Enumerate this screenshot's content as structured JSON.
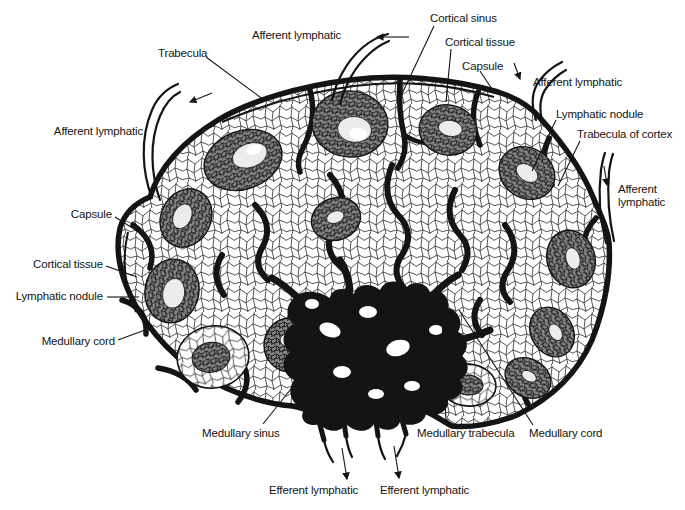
{
  "figure": {
    "background_color": "#ffffff",
    "ink_color": "#141414",
    "labels": [
      {
        "id": "trabecula",
        "text": "Trabecula"
      },
      {
        "id": "afferent-lymphatic-top",
        "text": "Afferent lymphatic"
      },
      {
        "id": "cortical-sinus",
        "text": "Cortical sinus"
      },
      {
        "id": "cortical-tissue-top",
        "text": "Cortical tissue"
      },
      {
        "id": "capsule-top",
        "text": "Capsule"
      },
      {
        "id": "afferent-lymphatic-upper-right",
        "text": "Afferent lymphatic"
      },
      {
        "id": "lymphatic-nodule-right",
        "text": "Lymphatic nodule"
      },
      {
        "id": "trabecula-of-cortex",
        "text": "Trabecula of cortex"
      },
      {
        "id": "afferent-lymphatic-far-right",
        "text": "Afferent lymphatic"
      },
      {
        "id": "afferent-lymphatic-left",
        "text": "Afferent lymphatic"
      },
      {
        "id": "capsule-left",
        "text": "Capsule"
      },
      {
        "id": "cortical-tissue-left",
        "text": "Cortical tissue"
      },
      {
        "id": "lymphatic-nodule-left",
        "text": "Lymphatic nodule"
      },
      {
        "id": "medullary-cord-left",
        "text": "Medullary cord"
      },
      {
        "id": "medullary-sinus",
        "text": "Medullary sinus"
      },
      {
        "id": "medullary-trabecula",
        "text": "Medullary trabecula"
      },
      {
        "id": "medullary-cord-right",
        "text": "Medullary cord"
      },
      {
        "id": "efferent-lymphatic-left",
        "text": "Efferent lymphatic"
      },
      {
        "id": "efferent-lymphatic-right",
        "text": "Efferent lymphatic"
      }
    ]
  }
}
